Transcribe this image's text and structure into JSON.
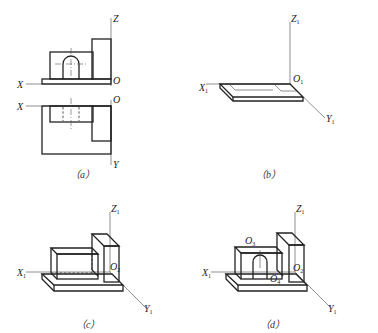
{
  "figure": {
    "panels": [
      {
        "id": "a",
        "caption": "（a）",
        "description": "Orthographic front and top views with axes X, Z, O, Y",
        "labels": {
          "z": "Z",
          "x_top": "X",
          "o_top": "O",
          "x_bottom": "X",
          "o_bottom": "O",
          "y": "Y"
        }
      },
      {
        "id": "b",
        "caption": "（b）",
        "description": "Isometric axes with base plate drawn",
        "labels": {
          "z": "Z",
          "z_sub": "1",
          "x": "X",
          "x_sub": "1",
          "o": "O",
          "o_sub": "1",
          "y": "Y",
          "y_sub": "1"
        }
      },
      {
        "id": "c",
        "caption": "（c）",
        "description": "Isometric with base, left block and right upright block",
        "labels": {
          "z": "Z",
          "z_sub": "1",
          "x": "X",
          "x_sub": "1",
          "o": "O",
          "o_sub": "2",
          "y": "Y",
          "y_sub": "1"
        }
      },
      {
        "id": "d",
        "caption": "（d）",
        "description": "Completed shaded isometric with arched slot",
        "labels": {
          "z": "Z",
          "z_sub": "1",
          "x": "X",
          "x_sub": "1",
          "o3": "O",
          "o3_sub": "3",
          "o4": "O",
          "o4_sub": "4",
          "o2": "O",
          "o2_sub": "2",
          "y": "Y",
          "y_sub": "1"
        }
      }
    ]
  }
}
